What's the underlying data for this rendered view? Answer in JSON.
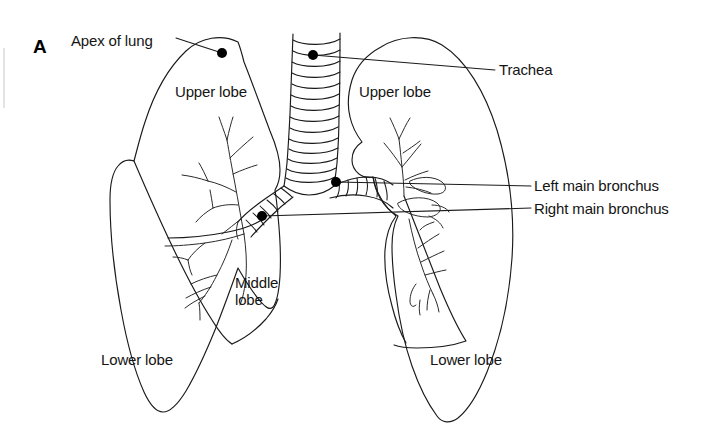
{
  "figure": {
    "panel_letter": "A",
    "background_color": "#ffffff",
    "line_color": "#1a1a1a",
    "marker_color": "#000000"
  },
  "labels": {
    "apex_of_lung": "Apex of lung",
    "trachea": "Trachea",
    "upper_lobe_left": "Upper lobe",
    "upper_lobe_right": "Upper lobe",
    "middle_lobe": "Middle\nlobe",
    "lower_lobe_left": "Lower lobe",
    "lower_lobe_right": "Lower lobe",
    "left_main_bronchus": "Left main bronchus",
    "right_main_bronchus": "Right main bronchus"
  },
  "callouts": [
    {
      "name": "apex-of-lung",
      "text": "Apex of lung",
      "dot_x": 222,
      "dot_y": 53,
      "label_x": 71,
      "label_y": 32
    },
    {
      "name": "trachea",
      "text": "Trachea",
      "dot_x": 313,
      "dot_y": 55,
      "label_x": 499,
      "label_y": 62
    },
    {
      "name": "left-main-bronchus",
      "text": "Left main bronchus",
      "dot_x": 336,
      "dot_y": 182,
      "label_x": 534,
      "label_y": 177
    },
    {
      "name": "right-main-bronchus",
      "text": "Right main bronchus",
      "dot_x": 262,
      "dot_y": 216,
      "label_x": 534,
      "label_y": 200
    }
  ],
  "lobe_labels": [
    {
      "name": "upper-lobe-left",
      "text": "Upper lobe",
      "x": 175,
      "y": 83
    },
    {
      "name": "upper-lobe-right",
      "text": "Upper lobe",
      "x": 359,
      "y": 83
    },
    {
      "name": "middle-lobe",
      "text": "Middle\nlobe",
      "x": 235,
      "y": 274
    },
    {
      "name": "lower-lobe-left",
      "text": "Lower lobe",
      "x": 101,
      "y": 351
    },
    {
      "name": "lower-lobe-right",
      "text": "Lower lobe",
      "x": 430,
      "y": 351
    }
  ],
  "anatomy": {
    "trachea_ring_count": 14,
    "structures": [
      "left lung outline",
      "right lung outline",
      "trachea with cartilage rings",
      "carina",
      "left main bronchus",
      "right main bronchus",
      "bronchial tree left",
      "bronchial tree right",
      "oblique fissure left",
      "horizontal fissure left",
      "oblique fissure right"
    ]
  }
}
